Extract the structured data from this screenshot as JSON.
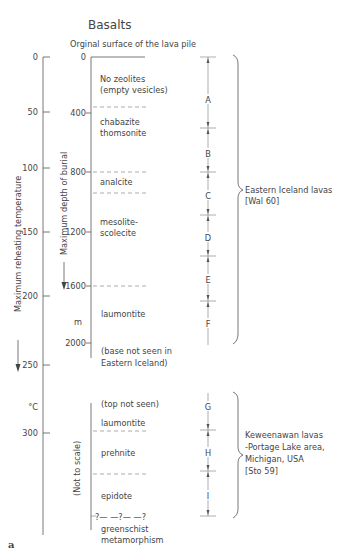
{
  "title": "Basalts",
  "subtitle": "Orginal surface of the lava pile",
  "panel_label": "a",
  "temperature_axis": {
    "label": "Maximum reheating temperature",
    "unit": "°C",
    "ticks": [
      "0",
      "50",
      "100",
      "150",
      "200",
      "250",
      "300"
    ]
  },
  "depth_axis": {
    "label": "Maximum depth of burial",
    "unit": "m",
    "ticks": [
      "0",
      "400",
      "800",
      "1200",
      "1600",
      "2000"
    ],
    "lower_label": "(Not to scale)"
  },
  "zones": [
    {
      "id": "A",
      "mineral_line1": "No zeolites",
      "mineral_line2": "(empty vesicles)"
    },
    {
      "id": "B",
      "mineral_line1": "chabazite",
      "mineral_line2": "thomsonite"
    },
    {
      "id": "C",
      "mineral_line1": "analcite",
      "mineral_line2": ""
    },
    {
      "id": "D",
      "mineral_line1": "mesolite-",
      "mineral_line2": "scolecite"
    },
    {
      "id": "E",
      "mineral_line1": "",
      "mineral_line2": ""
    },
    {
      "id": "F",
      "mineral_line1": "laumontite",
      "mineral_line2": ""
    },
    {
      "id": "G",
      "mineral_line1": "(top not seen)",
      "mineral_line2": "laumontite"
    },
    {
      "id": "H",
      "mineral_line1": "prehnite",
      "mineral_line2": ""
    },
    {
      "id": "I",
      "mineral_line1": "epidote",
      "mineral_line2": ""
    }
  ],
  "base_note": {
    "line1": "(base not seen in",
    "line2": "Eastern Iceland)"
  },
  "bottom_note": {
    "question": "?— —?— —?",
    "line1": "greenschist",
    "line2": "metamorphism"
  },
  "groups": [
    {
      "name": "eastern-iceland",
      "line1": "Eastern Iceland lavas",
      "line2": "[Wal 60]"
    },
    {
      "name": "keweenawan",
      "line1": "Keweenawan lavas",
      "line2": "-Portage Lake area,",
      "line3": "Michigan, USA",
      "line4": "[Sto 59]"
    }
  ]
}
